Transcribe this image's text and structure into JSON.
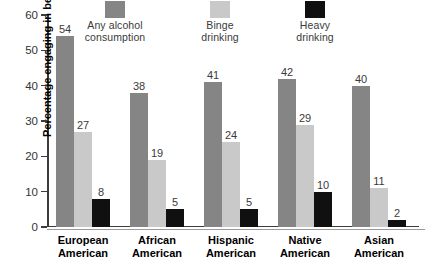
{
  "chart_data": {
    "type": "bar",
    "title": "",
    "xlabel": "",
    "ylabel": "Percentage engaging in behavior",
    "ylim": [
      0,
      60
    ],
    "yticks": [
      0,
      10,
      20,
      30,
      40,
      50,
      60
    ],
    "ytick_labels": [
      "0",
      "10",
      "20",
      "30",
      "40",
      "50",
      "60"
    ],
    "grid": false,
    "legend_position": "top",
    "categories": [
      "European\nAmerican",
      "African\nAmerican",
      "Hispanic\nAmerican",
      "Native\nAmerican",
      "Asian\nAmerican"
    ],
    "series": [
      {
        "name": "Any alcohol\nconsumption",
        "color": "#858585",
        "values": [
          54,
          38,
          41,
          42,
          40
        ],
        "labels": [
          "54",
          "38",
          "41",
          "42",
          "40"
        ]
      },
      {
        "name": "Binge\ndrinking",
        "color": "#c9c9c9",
        "values": [
          27,
          19,
          24,
          29,
          11
        ],
        "labels": [
          "27",
          "19",
          "24",
          "29",
          "11"
        ]
      },
      {
        "name": "Heavy\ndrinking",
        "color": "#101010",
        "values": [
          8,
          5,
          5,
          10,
          2
        ],
        "labels": [
          "8",
          "5",
          "5",
          "10",
          "2"
        ]
      }
    ]
  },
  "legend": [
    {
      "label": "Any alcohol\nconsumption",
      "color": "#858585",
      "swatch_name": "legend-swatch-any-alcohol"
    },
    {
      "label": "Binge\ndrinking",
      "color": "#c9c9c9",
      "swatch_name": "legend-swatch-binge"
    },
    {
      "label": "Heavy\ndrinking",
      "color": "#101010",
      "swatch_name": "legend-swatch-heavy"
    }
  ],
  "axis": {
    "y_label": "Percentage engaging in behavior",
    "y_ticks": [
      "60",
      "50",
      "40",
      "30",
      "20",
      "10",
      "0"
    ]
  }
}
